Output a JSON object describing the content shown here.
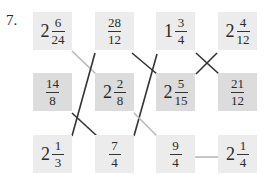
{
  "problem_number": "7.",
  "cards": [
    {
      "id": "r1c1",
      "whole": "2",
      "num": "6",
      "den": "24",
      "shade": "light",
      "x": 33,
      "y": 12
    },
    {
      "id": "r1c2",
      "whole": "",
      "num": "28",
      "den": "12",
      "shade": "light",
      "x": 95,
      "y": 12
    },
    {
      "id": "r1c3",
      "whole": "1",
      "num": "3",
      "den": "4",
      "shade": "light",
      "x": 156,
      "y": 12
    },
    {
      "id": "r1c4",
      "whole": "2",
      "num": "4",
      "den": "12",
      "shade": "light",
      "x": 218,
      "y": 12
    },
    {
      "id": "r2c1",
      "whole": "",
      "num": "14",
      "den": "8",
      "shade": "dark",
      "x": 33,
      "y": 73
    },
    {
      "id": "r2c2",
      "whole": "2",
      "num": "2",
      "den": "8",
      "shade": "dark",
      "x": 95,
      "y": 73
    },
    {
      "id": "r2c3",
      "whole": "2",
      "num": "5",
      "den": "15",
      "shade": "dark",
      "x": 156,
      "y": 73
    },
    {
      "id": "r2c4",
      "whole": "",
      "num": "21",
      "den": "12",
      "shade": "dark",
      "x": 218,
      "y": 73
    },
    {
      "id": "r3c1",
      "whole": "2",
      "num": "1",
      "den": "3",
      "shade": "light",
      "x": 33,
      "y": 135
    },
    {
      "id": "r3c2",
      "whole": "",
      "num": "7",
      "den": "4",
      "shade": "light",
      "x": 95,
      "y": 135
    },
    {
      "id": "r3c3",
      "whole": "",
      "num": "9",
      "den": "4",
      "shade": "light",
      "x": 156,
      "y": 135
    },
    {
      "id": "r3c4",
      "whole": "2",
      "num": "1",
      "den": "4",
      "shade": "light",
      "x": 218,
      "y": 135
    }
  ],
  "connections": [
    {
      "from": "2 6/24",
      "to": "2 2/8",
      "color": "#b8b8b8",
      "x1": 72,
      "y1": 51,
      "x2": 96,
      "y2": 74
    },
    {
      "from": "28/12",
      "to": "2 1/3",
      "color": "#333333",
      "x1": 95,
      "y1": 53,
      "x2": 72,
      "y2": 136
    },
    {
      "from": "28/12",
      "to": "1 3/4",
      "color": "#333333",
      "x1": 132,
      "y1": 53,
      "x2": 157,
      "y2": 74
    },
    {
      "from": "14/8",
      "to": "7/4",
      "color": "#333333",
      "x1": 72,
      "y1": 113,
      "x2": 97,
      "y2": 136
    },
    {
      "from": "2 5/15",
      "to": "7/4",
      "color": "#333333",
      "x1": 157,
      "y1": 54,
      "x2": 134,
      "y2": 136
    },
    {
      "from": "2 2/8",
      "to": "9/4",
      "color": "#b8b8b8",
      "x1": 134,
      "y1": 113,
      "x2": 157,
      "y2": 136
    },
    {
      "from": "1 3/4",
      "to": "21/12",
      "color": "#333333",
      "x1": 196,
      "y1": 53,
      "x2": 219,
      "y2": 74
    },
    {
      "from": "2 4/12",
      "to": "2 5/15",
      "color": "#333333",
      "x1": 217,
      "y1": 53,
      "x2": 196,
      "y2": 74
    },
    {
      "from": "9/4",
      "to": "2 1/4",
      "color": "#b8b8b8",
      "x1": 195,
      "y1": 157,
      "x2": 218,
      "y2": 157
    }
  ]
}
